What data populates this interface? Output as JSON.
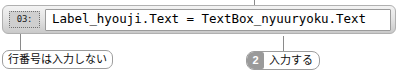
{
  "code_bar": {
    "line_number": "03:",
    "code": "Label_hyouji.Text = TextBox_nyuuryoku.Text"
  },
  "callouts": {
    "line_number_note": "行番号は入力しない",
    "input_step": {
      "badge": "2",
      "label": "入力する"
    }
  },
  "colors": {
    "bar_fill": "#e3e3e3",
    "bar_border": "#b0b0b0",
    "code_field_bg": "#ffffff",
    "chip_bg": "#cfcfcf",
    "badge_bg": "#9a9a9a",
    "leader_line": "#8a8a8a",
    "text": "#000000"
  }
}
